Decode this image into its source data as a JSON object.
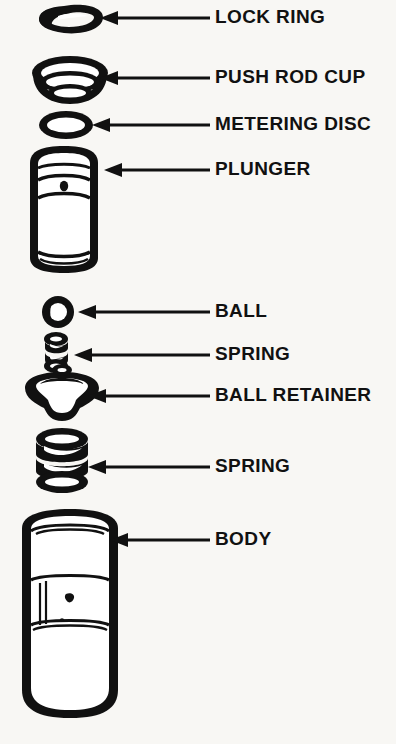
{
  "diagram": {
    "background_color": "#f8f7f4",
    "ink_color": "#111111",
    "callouts": [
      {
        "id": "lock-ring",
        "label": "LOCK RING",
        "part": "lock-ring",
        "label_x": 215,
        "label_y": 18,
        "leader_from_x": 210,
        "leader_to_x": 100,
        "leader_y": 18
      },
      {
        "id": "push-rod-cup",
        "label": "PUSH ROD CUP",
        "part": "push-rod-cup",
        "label_x": 215,
        "label_y": 78,
        "leader_from_x": 210,
        "leader_to_x": 100,
        "leader_y": 78
      },
      {
        "id": "metering-disc",
        "label": "METERING DISC",
        "part": "metering-disc",
        "label_x": 215,
        "label_y": 125,
        "leader_from_x": 210,
        "leader_to_x": 92,
        "leader_y": 125
      },
      {
        "id": "plunger",
        "label": "PLUNGER",
        "part": "plunger",
        "label_x": 215,
        "label_y": 170,
        "leader_from_x": 210,
        "leader_to_x": 104,
        "leader_y": 170
      },
      {
        "id": "ball",
        "label": "BALL",
        "part": "ball",
        "label_x": 215,
        "label_y": 312,
        "leader_from_x": 210,
        "leader_to_x": 78,
        "leader_y": 312
      },
      {
        "id": "spring-upper",
        "label": "SPRING",
        "part": "spring-upper",
        "label_x": 215,
        "label_y": 355,
        "leader_from_x": 210,
        "leader_to_x": 74,
        "leader_y": 355
      },
      {
        "id": "ball-retainer",
        "label": "BALL RETAINER",
        "part": "ball-retainer",
        "label_x": 215,
        "label_y": 396,
        "leader_from_x": 210,
        "leader_to_x": 88,
        "leader_y": 396
      },
      {
        "id": "spring-lower",
        "label": "SPRING",
        "part": "spring-lower",
        "label_x": 215,
        "label_y": 467,
        "leader_from_x": 210,
        "leader_to_x": 88,
        "leader_y": 467
      },
      {
        "id": "body",
        "label": "BODY",
        "part": "body",
        "label_x": 215,
        "label_y": 540,
        "leader_from_x": 210,
        "leader_to_x": 110,
        "leader_y": 540
      }
    ],
    "parts_order": [
      "LOCK RING",
      "PUSH ROD CUP",
      "METERING DISC",
      "PLUNGER",
      "BALL",
      "SPRING",
      "BALL RETAINER",
      "SPRING",
      "BODY"
    ]
  }
}
